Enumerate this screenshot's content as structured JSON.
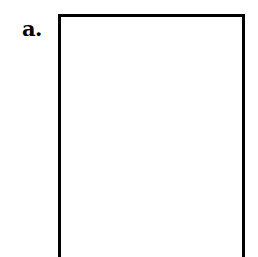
{
  "figure": {
    "panel": {
      "label": "a.",
      "frame_color": "#000000",
      "content": ""
    }
  }
}
